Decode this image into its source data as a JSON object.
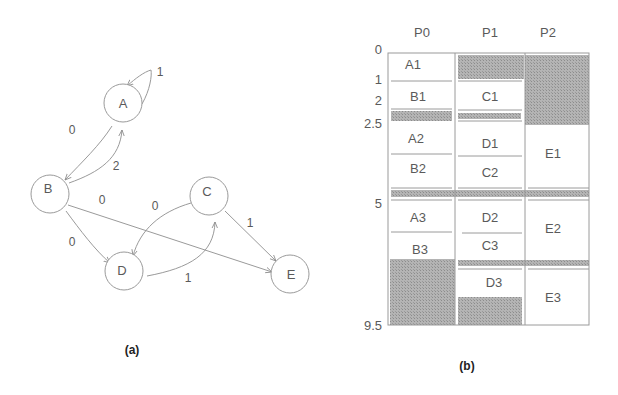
{
  "panel_a": {
    "caption": "(a)",
    "nodes": [
      {
        "id": "A",
        "label": "A",
        "cx": 123,
        "cy": 103
      },
      {
        "id": "B",
        "label": "B",
        "cx": 50,
        "cy": 194
      },
      {
        "id": "C",
        "label": "C",
        "cx": 209,
        "cy": 196
      },
      {
        "id": "D",
        "label": "D",
        "cx": 124,
        "cy": 271
      },
      {
        "id": "E",
        "label": "E",
        "cx": 290,
        "cy": 274
      }
    ],
    "edges": [
      {
        "from": "A",
        "to": "A",
        "weight": "1"
      },
      {
        "from": "A",
        "to": "B",
        "weight": "0"
      },
      {
        "from": "B",
        "to": "A",
        "weight": "2"
      },
      {
        "from": "B",
        "to": "E",
        "weight": "0"
      },
      {
        "from": "B",
        "to": "D",
        "weight": "0"
      },
      {
        "from": "C",
        "to": "D",
        "weight": "0"
      },
      {
        "from": "C",
        "to": "E",
        "weight": "1"
      },
      {
        "from": "D",
        "to": "C",
        "weight": "1"
      }
    ]
  },
  "panel_b": {
    "caption": "(b)",
    "columns": [
      "P0",
      "P1",
      "P2"
    ],
    "y_ticks": [
      "0",
      "1",
      "2",
      "2.5",
      "5",
      "9.5"
    ],
    "tasks": {
      "P0": [
        "A1",
        "B1",
        "A2",
        "B2",
        "A3",
        "B3"
      ],
      "P1": [
        "C1",
        "D1",
        "C2",
        "D2",
        "C3",
        "D3"
      ],
      "P2": [
        "E1",
        "E2",
        "E3"
      ]
    }
  }
}
